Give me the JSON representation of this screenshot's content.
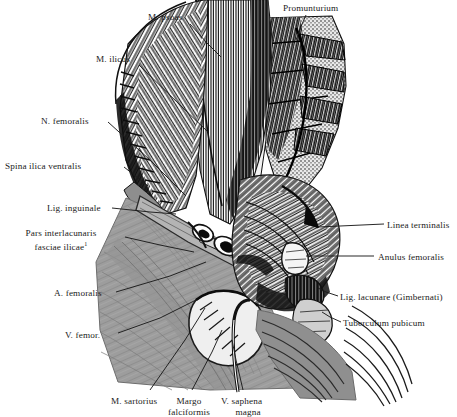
{
  "figure": {
    "title_visible": false,
    "style": "engraving",
    "background_color": "#ffffff",
    "ink_color": "#1b1b1b",
    "fascia_color": "#9a9a9a"
  },
  "labels": [
    {
      "id": "promunturium",
      "text": "Promunturium",
      "x": 283,
      "y": 3,
      "align": "left"
    },
    {
      "id": "m-psoas",
      "text": "M. psoas",
      "x": 148,
      "y": 12,
      "align": "left"
    },
    {
      "id": "m-ilicus",
      "text": "M. ilicus",
      "x": 96,
      "y": 54,
      "align": "left"
    },
    {
      "id": "n-femoralis",
      "text": "N. femoralis",
      "x": 41,
      "y": 116,
      "align": "left"
    },
    {
      "id": "spina-ilica",
      "text": "Spina ilica ventralis",
      "x": 5,
      "y": 161,
      "align": "left"
    },
    {
      "id": "lig-inguinale",
      "text": "Lig. inguinale",
      "x": 47,
      "y": 203,
      "align": "left"
    },
    {
      "id": "a-femoralis",
      "text": "A. femoralis",
      "x": 54,
      "y": 288,
      "align": "left"
    },
    {
      "id": "v-femor",
      "text": "V. femor.",
      "x": 65,
      "y": 330,
      "align": "left"
    },
    {
      "id": "linea-terminalis",
      "text": "Linea terminalis",
      "x": 387,
      "y": 220,
      "align": "left"
    },
    {
      "id": "anulus-femoralis",
      "text": "Anulus femoralis",
      "x": 378,
      "y": 252,
      "align": "left"
    },
    {
      "id": "lig-lacunare",
      "text": "Lig. lacunare (Gimbernati)",
      "x": 340,
      "y": 292,
      "align": "left"
    },
    {
      "id": "tuberculum",
      "text": "Tuberculum pubicum",
      "x": 343,
      "y": 318,
      "align": "left"
    },
    {
      "id": "m-sartorius",
      "text": "M. sartorius",
      "x": 111,
      "y": 396,
      "align": "left"
    },
    {
      "id": "v-saphena",
      "text": "V. saphena",
      "x": 221,
      "y": 396,
      "align": "left"
    }
  ],
  "labels_multiline": [
    {
      "id": "pars-interlacunaris",
      "x": 2,
      "y": 228,
      "width": 118,
      "align": "center",
      "lines": [
        "Pars interlacunaris",
        "fasciae ilicae"
      ],
      "footnote_marker": "1"
    },
    {
      "id": "margo-falciformis",
      "x": 160,
      "y": 396,
      "width": 58,
      "align": "center",
      "lines": [
        "Margo",
        "falciformis"
      ]
    },
    {
      "id": "v-saphena-magna-second-line",
      "x": 218,
      "y": 407,
      "width": 60,
      "align": "center",
      "lines": [
        "magna"
      ]
    }
  ],
  "leaders": [
    {
      "id": "leader-promunturium",
      "points": "306,15 300,29 296,40"
    },
    {
      "id": "leader-m-psoas",
      "points": "190,24 207,43 221,57"
    },
    {
      "id": "leader-m-ilicus",
      "points": "139,65 180,105 208,132"
    },
    {
      "id": "leader-n-femoralis",
      "points": "108,122 150,160 186,196"
    },
    {
      "id": "leader-spina-ilica",
      "points": "124,167 138,178 148,186"
    },
    {
      "id": "leader-lig-inguinale",
      "points": "112,208 150,212 176,214"
    },
    {
      "id": "leader-pars-inter",
      "points": "125,237 160,245 194,252"
    },
    {
      "id": "leader-a-femoralis",
      "points": "116,292 170,276 206,262"
    },
    {
      "id": "leader-v-femor",
      "points": "118,333 160,318 196,300"
    },
    {
      "id": "leader-linea-term",
      "points": "384,224 340,226 318,227"
    },
    {
      "id": "leader-anulus-fem",
      "points": "374,256 330,256 306,256"
    },
    {
      "id": "leader-lig-lacunare",
      "points": "338,296 326,292 318,288"
    },
    {
      "id": "leader-tuberculum",
      "points": "341,322 330,317 322,312"
    },
    {
      "id": "leader-m-sartorius",
      "points": "150,390 185,340 205,308"
    },
    {
      "id": "leader-margo-falc",
      "points": "192,390 212,352 222,330"
    },
    {
      "id": "leader-v-saphena",
      "points": "243,390 236,360 232,340"
    }
  ],
  "footnote": {
    "marker": "1",
    "shown": true
  }
}
